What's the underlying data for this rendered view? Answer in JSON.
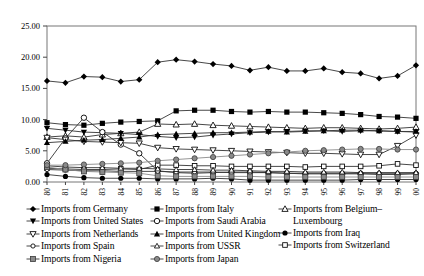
{
  "chart_data": {
    "type": "line",
    "title": "",
    "xlabel": "",
    "ylabel": "",
    "ylim": [
      0,
      25
    ],
    "ytick_step": 5,
    "ytick_labels": [
      "0.00",
      "5.00",
      "10.00",
      "15.00",
      "20.00",
      "25.00"
    ],
    "grid": false,
    "legend_position": "bottom",
    "legend_columns": 3,
    "x": [
      1980,
      1981,
      1982,
      1983,
      1984,
      1985,
      1986,
      1987,
      1988,
      1989,
      1990,
      1991,
      1992,
      1993,
      1994,
      1995,
      1996,
      1997,
      1998,
      1999,
      2000
    ],
    "xtick_labels": [
      "1980",
      "1981",
      "1982",
      "1983",
      "1984",
      "1985",
      "1986",
      "1987",
      "1988",
      "1989",
      "1990",
      "1991",
      "1992",
      "1993",
      "1994",
      "1995",
      "1996",
      "1997",
      "1998",
      "1999",
      "2000"
    ],
    "series": [
      {
        "name": "Imports from Germany",
        "marker": "filled-diamond",
        "color": "#000000",
        "values": [
          16.2,
          15.9,
          16.9,
          16.8,
          16.1,
          16.4,
          19.2,
          19.6,
          19.3,
          18.9,
          18.6,
          17.9,
          18.4,
          17.8,
          17.8,
          18.2,
          17.6,
          17.4,
          16.6,
          17.0,
          18.7
        ]
      },
      {
        "name": "Imports from Italy",
        "marker": "filled-square",
        "color": "#000000",
        "values": [
          9.5,
          9.2,
          9.1,
          9.4,
          9.6,
          9.7,
          9.8,
          11.4,
          11.5,
          11.5,
          11.3,
          11.2,
          11.3,
          11.2,
          11.2,
          11.1,
          11.0,
          10.8,
          10.5,
          10.4,
          10.2
        ]
      },
      {
        "name": "Imports from Belgium–Luxembourg",
        "marker": "open-triangle",
        "color": "#000000",
        "values": [
          7.2,
          7.4,
          7.2,
          7.6,
          7.8,
          8.0,
          9.3,
          9.2,
          9.3,
          9.1,
          9.0,
          8.9,
          8.8,
          8.7,
          8.6,
          8.7,
          8.7,
          8.6,
          8.5,
          8.6,
          8.8
        ]
      },
      {
        "name": "Imports from United States",
        "marker": "filled-down-triangle",
        "color": "#000000",
        "values": [
          8.6,
          8.3,
          8.0,
          7.9,
          7.8,
          7.6,
          7.3,
          7.1,
          7.2,
          7.5,
          7.7,
          7.9,
          8.0,
          8.1,
          8.2,
          8.2,
          8.1,
          8.2,
          8.2,
          8.1,
          8.0
        ]
      },
      {
        "name": "Imports from Saudi Arabia",
        "marker": "open-circle",
        "color": "#000000",
        "values": [
          3.0,
          7.0,
          10.3,
          8.0,
          6.0,
          4.6,
          1.8,
          1.5,
          1.4,
          1.5,
          1.6,
          1.6,
          1.5,
          1.4,
          1.3,
          1.3,
          1.3,
          1.3,
          1.2,
          1.2,
          1.3
        ]
      },
      {
        "name": "Imports from Switzerland",
        "marker": "open-square-small",
        "color": "#000000",
        "values": [
          2.2,
          2.1,
          2.0,
          2.0,
          2.1,
          2.0,
          2.7,
          2.7,
          2.6,
          2.6,
          2.5,
          2.5,
          2.5,
          2.5,
          2.4,
          2.5,
          2.5,
          2.5,
          2.6,
          2.9,
          2.7
        ]
      },
      {
        "name": "Imports from Netherlands",
        "marker": "open-down-triangle",
        "color": "#000000",
        "values": [
          7.1,
          6.8,
          6.5,
          6.4,
          6.3,
          6.2,
          5.5,
          5.3,
          5.2,
          5.1,
          5.0,
          4.9,
          4.8,
          4.7,
          4.6,
          4.6,
          4.5,
          4.4,
          4.4,
          5.8,
          7.5
        ]
      },
      {
        "name": "Imports from United Kingdom",
        "marker": "filled-triangle",
        "color": "#000000",
        "values": [
          6.3,
          6.5,
          6.7,
          6.8,
          7.0,
          7.2,
          7.6,
          7.7,
          7.8,
          7.9,
          7.9,
          8.0,
          8.1,
          8.0,
          8.1,
          8.2,
          8.3,
          8.3,
          8.2,
          8.1,
          8.1
        ]
      },
      {
        "name": "Imports from Iraq",
        "marker": "filled-circle",
        "color": "#000000",
        "values": [
          1.2,
          0.9,
          0.7,
          0.6,
          0.6,
          0.6,
          0.5,
          0.5,
          0.5,
          0.6,
          0.5,
          0.3,
          0.3,
          0.3,
          0.3,
          0.3,
          0.3,
          0.4,
          0.4,
          0.4,
          0.4
        ]
      },
      {
        "name": "Imports from Spain",
        "marker": "open-circle-small",
        "color": "#000000",
        "values": [
          2.0,
          1.9,
          1.8,
          1.8,
          1.7,
          1.7,
          1.7,
          1.6,
          1.6,
          1.6,
          1.5,
          1.5,
          1.5,
          1.4,
          1.4,
          1.4,
          1.4,
          1.4,
          1.4,
          1.4,
          1.4
        ]
      },
      {
        "name": "Imports from USSR",
        "marker": "open-up-triangle-small",
        "color": "#000000",
        "values": [
          2.6,
          2.4,
          2.3,
          2.3,
          2.2,
          2.2,
          2.1,
          2.0,
          2.0,
          1.9,
          1.9,
          1.8,
          1.7,
          1.7,
          1.6,
          1.6,
          1.6,
          1.5,
          1.5,
          1.5,
          1.5
        ]
      },
      {
        "name": "Imports from Nigeria",
        "marker": "gray-square",
        "color": "#808080",
        "values": [
          2.4,
          2.0,
          1.7,
          1.6,
          1.5,
          1.4,
          1.0,
          0.9,
          0.9,
          0.9,
          0.9,
          0.9,
          0.8,
          0.8,
          0.8,
          0.8,
          0.8,
          0.8,
          0.8,
          0.8,
          0.8
        ]
      },
      {
        "name": "Imports from Japan",
        "marker": "gray-circle",
        "color": "#808080",
        "values": [
          2.7,
          2.7,
          2.8,
          2.9,
          3.0,
          3.1,
          3.4,
          3.6,
          3.8,
          4.0,
          4.2,
          4.4,
          4.6,
          4.8,
          5.0,
          5.1,
          5.2,
          5.3,
          5.3,
          5.2,
          5.2
        ]
      }
    ]
  },
  "legend": {
    "columns": [
      {
        "items": [
          {
            "label": "Imports from Germany",
            "marker": "filled-diamond"
          },
          {
            "label": "Imports from United States",
            "marker": "filled-down-triangle"
          },
          {
            "label": "Imports from Netherlands",
            "marker": "open-down-triangle"
          },
          {
            "label": "Imports from Spain",
            "marker": "open-circle-small"
          },
          {
            "label": "Imports from Nigeria",
            "marker": "gray-square"
          }
        ]
      },
      {
        "items": [
          {
            "label": "Imports from Italy",
            "marker": "filled-square"
          },
          {
            "label": "Imports from Saudi Arabia",
            "marker": "open-circle"
          },
          {
            "label": "Imports from United Kingdom",
            "marker": "filled-triangle"
          },
          {
            "label": "Imports from USSR",
            "marker": "open-up-triangle-small"
          },
          {
            "label": "Imports from Japan",
            "marker": "gray-circle"
          }
        ]
      },
      {
        "items": [
          {
            "label": "Imports from Belgium–",
            "label2": "Luxembourg",
            "marker": "open-triangle"
          },
          {
            "label": "Imports from Iraq",
            "marker": "filled-circle"
          },
          {
            "label": "Imports from Switzerland",
            "marker": "open-square-small"
          }
        ]
      }
    ]
  }
}
